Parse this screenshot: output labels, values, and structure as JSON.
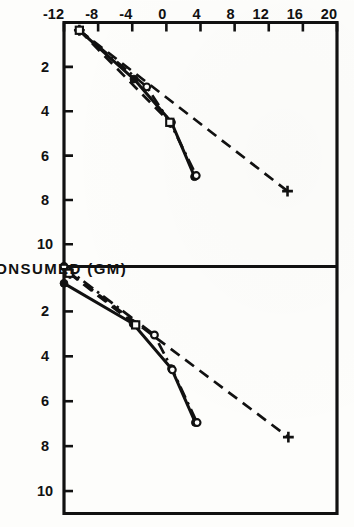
{
  "figure": {
    "orientation_note": "rotated",
    "background_color": "#fdfdfb",
    "ink_color": "#111111"
  },
  "axes": {
    "x_axis_title": "PROTEIN CONSUMED (GM)",
    "y_axis_title": "WEIGHT CHANGE (GM)",
    "x_ticks": [
      "2",
      "4",
      "6",
      "8",
      "10"
    ],
    "y_ticks": [
      "20",
      "16",
      "12",
      "8",
      "4",
      "0",
      "-4",
      "-8",
      "-12"
    ]
  },
  "chart_data": {
    "type": "line",
    "title": "",
    "subtitle": "",
    "xlabel": "PROTEIN CONSUMED (GM)",
    "ylabel": "WEIGHT CHANGE (GM)",
    "grid": false,
    "legend": null,
    "legend_position": "none",
    "panels": [
      {
        "name": "left-panel",
        "xlim": [
          0,
          11
        ],
        "ylim": [
          -12,
          20
        ],
        "xticks": [
          2,
          4,
          6,
          8,
          10
        ],
        "yticks": [
          20,
          16,
          12,
          8,
          4,
          0,
          -4,
          -8,
          -12
        ],
        "series": [
          {
            "name": "series-plus-dashed",
            "marker": "plus",
            "linestyle": "dashed",
            "x": [
              0.35,
              7.6
            ],
            "y": [
              -10.2,
              14.2
            ]
          },
          {
            "name": "series-filled-circle-solid",
            "marker": "filled-circle",
            "linestyle": "solid",
            "x": [
              0.35,
              2.55,
              4.5,
              6.95
            ],
            "y": [
              -10.2,
              -3.8,
              0.6,
              3.3
            ]
          },
          {
            "name": "series-open-circle-dashdot",
            "marker": "open-circle",
            "linestyle": "dashdot",
            "x": [
              0.35,
              2.9,
              4.55,
              6.9
            ],
            "y": [
              -10.2,
              -2.3,
              0.5,
              3.5
            ]
          },
          {
            "name": "series-square-dashed",
            "marker": "square",
            "linestyle": "dashed",
            "x": [
              0.35,
              4.5
            ],
            "y": [
              -10.2,
              0.4
            ]
          }
        ]
      },
      {
        "name": "right-panel",
        "xlim": [
          0,
          11
        ],
        "ylim": [
          -12,
          20
        ],
        "xticks": [
          2,
          4,
          6,
          8,
          10
        ],
        "yticks": [
          20,
          16,
          12,
          8,
          4,
          0,
          -4,
          -8,
          -12
        ],
        "series": [
          {
            "name": "series-plus-dashed",
            "marker": "plus",
            "linestyle": "dashed",
            "x": [
              0.3,
              7.6
            ],
            "y": [
              -11.3,
              14.3
            ]
          },
          {
            "name": "series-filled-circle-solid",
            "marker": "filled-circle",
            "linestyle": "solid",
            "x": [
              0.75,
              2.55,
              4.55,
              6.95
            ],
            "y": [
              -12.0,
              -3.9,
              0.6,
              3.4
            ]
          },
          {
            "name": "series-open-circle-dashdot",
            "marker": "open-circle",
            "linestyle": "dashdot",
            "x": [
              0.0,
              3.05,
              4.6,
              6.95
            ],
            "y": [
              -12.0,
              -1.4,
              0.7,
              3.6
            ]
          },
          {
            "name": "series-square-dashed",
            "marker": "square",
            "linestyle": "dashed",
            "x": [
              0.3,
              2.6
            ],
            "y": [
              -11.4,
              -3.6
            ]
          }
        ]
      }
    ]
  }
}
